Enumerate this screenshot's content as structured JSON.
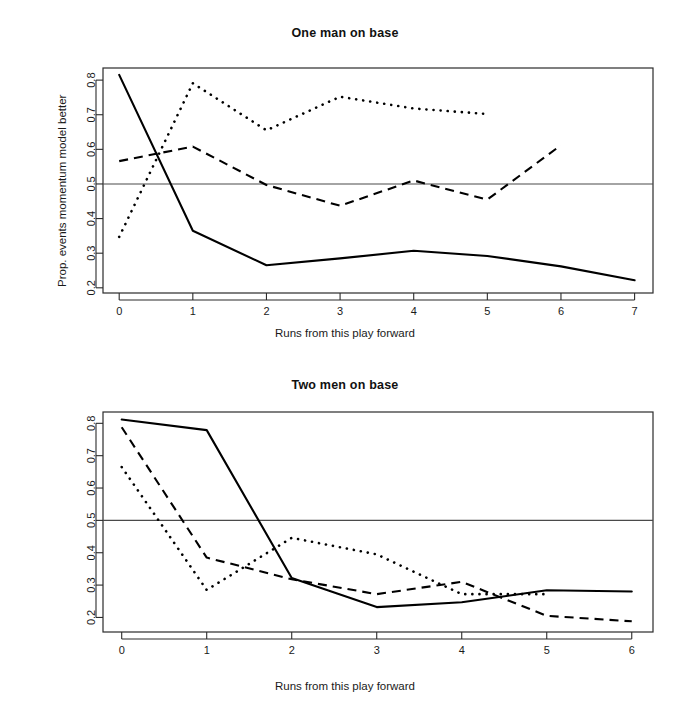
{
  "figure": {
    "background": "#ffffff",
    "ink_color": "#000000",
    "reference_line_value": 0.5
  },
  "panels": [
    {
      "id": "one-man-on-base",
      "title": "One man on base",
      "xlabel": "Runs from this play forward",
      "ylabel": "Prop. events momentum model better"
    },
    {
      "id": "two-men-on-base",
      "title": "Two men on base",
      "xlabel": "Runs from this play forward",
      "ylabel": "Prop. events momentum model better"
    }
  ],
  "chart_data": [
    {
      "type": "line",
      "title": "One man on base",
      "xlabel": "Runs from this play forward",
      "ylabel": "Prop. events momentum model better",
      "xlim": [
        -0.22,
        7.25
      ],
      "ylim": [
        0.185,
        0.835
      ],
      "xticks": [
        0,
        1,
        2,
        3,
        4,
        5,
        6,
        7
      ],
      "xtick_labels": [
        "0",
        "1",
        "2",
        "3",
        "4",
        "5",
        "6",
        "7"
      ],
      "yticks": [
        0.2,
        0.3,
        0.4,
        0.5,
        0.6,
        0.7,
        0.8
      ],
      "ytick_labels": [
        "0.2",
        "0.3",
        "0.4",
        "0.5",
        "0.6",
        "0.7",
        "0.8"
      ],
      "grid": false,
      "legend": "none",
      "reference_lines": [
        {
          "axis": "y",
          "value": 0.5
        }
      ],
      "series": [
        {
          "name": "solid",
          "style": "solid",
          "x": [
            0,
            1,
            2,
            3,
            4,
            5,
            6,
            7
          ],
          "values": [
            0.815,
            0.365,
            0.265,
            0.285,
            0.307,
            0.292,
            0.262,
            0.222
          ]
        },
        {
          "name": "dashed",
          "style": "dashed",
          "x": [
            0,
            1,
            2,
            3,
            4,
            5,
            6
          ],
          "values": [
            0.566,
            0.608,
            0.497,
            0.437,
            0.51,
            0.455,
            0.612
          ]
        },
        {
          "name": "dotted",
          "style": "dotted",
          "x": [
            0,
            1,
            2,
            3,
            4,
            5
          ],
          "values": [
            0.347,
            0.791,
            0.655,
            0.752,
            0.718,
            0.702
          ]
        }
      ]
    },
    {
      "type": "line",
      "title": "Two men on base",
      "xlabel": "Runs from this play forward",
      "ylabel": "Prop. events momentum model better",
      "xlim": [
        -0.22,
        6.25
      ],
      "ylim": [
        0.155,
        0.835
      ],
      "xticks": [
        0,
        1,
        2,
        3,
        4,
        5,
        6
      ],
      "xtick_labels": [
        "0",
        "1",
        "2",
        "3",
        "4",
        "5",
        "6"
      ],
      "yticks": [
        0.2,
        0.3,
        0.4,
        0.5,
        0.6,
        0.7,
        0.8
      ],
      "ytick_labels": [
        "0.2",
        "0.3",
        "0.4",
        "0.5",
        "0.6",
        "0.7",
        "0.8"
      ],
      "grid": false,
      "legend": "none",
      "reference_lines": [
        {
          "axis": "y",
          "value": 0.5
        }
      ],
      "series": [
        {
          "name": "solid",
          "style": "solid",
          "x": [
            0,
            1,
            2,
            3,
            4,
            5,
            6
          ],
          "values": [
            0.812,
            0.779,
            0.322,
            0.232,
            0.247,
            0.284,
            0.28
          ]
        },
        {
          "name": "dashed",
          "style": "dashed",
          "x": [
            0,
            1,
            2,
            3,
            4,
            5,
            6
          ],
          "values": [
            0.788,
            0.385,
            0.318,
            0.272,
            0.31,
            0.205,
            0.188
          ]
        },
        {
          "name": "dotted",
          "style": "dotted",
          "x": [
            0,
            1,
            2,
            3,
            4,
            5
          ],
          "values": [
            0.665,
            0.285,
            0.446,
            0.395,
            0.272,
            0.272
          ]
        }
      ]
    }
  ]
}
